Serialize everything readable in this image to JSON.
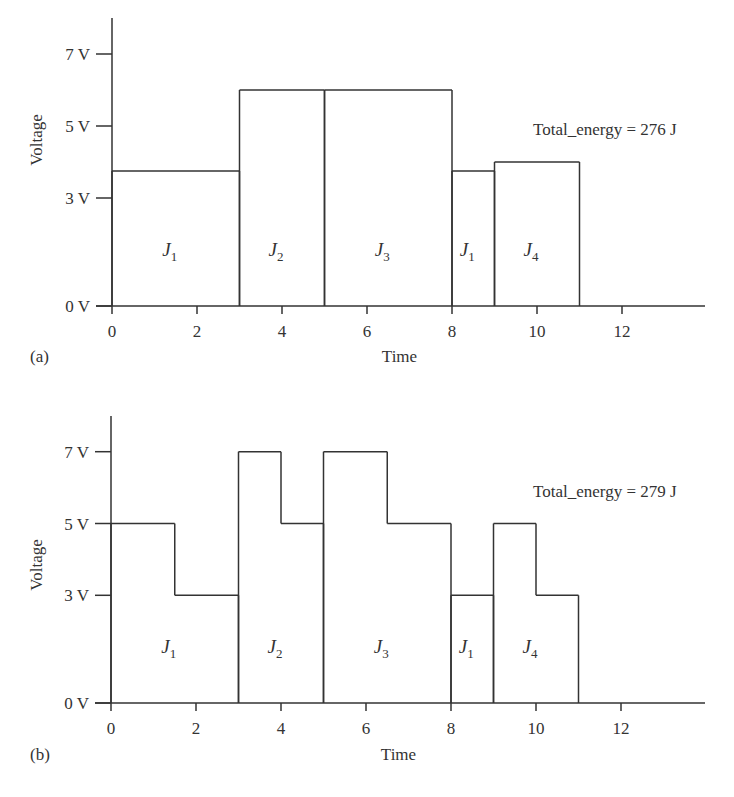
{
  "chart_data": [
    {
      "panel": "(a)",
      "type": "step",
      "title": "",
      "xlabel": "Time",
      "ylabel": "Voltage",
      "xticks": [
        "0",
        "2",
        "4",
        "6",
        "8",
        "10",
        "12"
      ],
      "yticks": [
        "0 V",
        "3 V",
        "5 V",
        "7 V"
      ],
      "xlim": [
        0,
        14
      ],
      "ylim": [
        0,
        8
      ],
      "annotation": "Total_energy = 276 J",
      "segments": [
        {
          "job": "J",
          "sub": "1",
          "t_start": 0,
          "t_end": 3,
          "voltage": 3.75
        },
        {
          "job": "J",
          "sub": "2",
          "t_start": 3,
          "t_end": 5,
          "voltage": 6
        },
        {
          "job": "J",
          "sub": "3",
          "t_start": 5,
          "t_end": 8,
          "voltage": 6
        },
        {
          "job": "J",
          "sub": "1",
          "t_start": 8,
          "t_end": 9,
          "voltage": 3.75
        },
        {
          "job": "J",
          "sub": "4",
          "t_start": 9,
          "t_end": 11,
          "voltage": 4
        }
      ]
    },
    {
      "panel": "(b)",
      "type": "step",
      "title": "",
      "xlabel": "Time",
      "ylabel": "Voltage",
      "xticks": [
        "0",
        "2",
        "4",
        "6",
        "8",
        "10",
        "12"
      ],
      "yticks": [
        "0 V",
        "3 V",
        "5 V",
        "7 V"
      ],
      "xlim": [
        0,
        14
      ],
      "ylim": [
        0,
        8
      ],
      "annotation": "Total_energy = 279 J",
      "segments": [
        {
          "job": "J",
          "sub": "1",
          "t_start": 0,
          "t_end": 3,
          "levels": [
            {
              "t_start": 0,
              "t_end": 1.5,
              "voltage": 5
            },
            {
              "t_start": 1.5,
              "t_end": 3,
              "voltage": 3
            }
          ]
        },
        {
          "job": "J",
          "sub": "2",
          "t_start": 3,
          "t_end": 5,
          "levels": [
            {
              "t_start": 3,
              "t_end": 4,
              "voltage": 7
            },
            {
              "t_start": 4,
              "t_end": 5,
              "voltage": 5
            }
          ]
        },
        {
          "job": "J",
          "sub": "3",
          "t_start": 5,
          "t_end": 8,
          "levels": [
            {
              "t_start": 5,
              "t_end": 6.5,
              "voltage": 7
            },
            {
              "t_start": 6.5,
              "t_end": 8,
              "voltage": 5
            }
          ]
        },
        {
          "job": "J",
          "sub": "1",
          "t_start": 8,
          "t_end": 9,
          "levels": [
            {
              "t_start": 8,
              "t_end": 9,
              "voltage": 3
            }
          ]
        },
        {
          "job": "J",
          "sub": "4",
          "t_start": 9,
          "t_end": 11,
          "levels": [
            {
              "t_start": 9,
              "t_end": 10,
              "voltage": 5
            },
            {
              "t_start": 10,
              "t_end": 11,
              "voltage": 3
            }
          ]
        }
      ]
    }
  ],
  "style": {
    "line_color": "#333333",
    "background": "#ffffff"
  }
}
